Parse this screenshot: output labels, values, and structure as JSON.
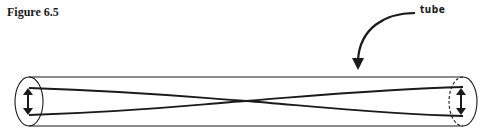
{
  "figure": {
    "title": "Figure 6.5",
    "label": "tube",
    "stroke_color": "#1a1a1a",
    "background": "#ffffff"
  },
  "diagram": {
    "elements": [
      {
        "type": "cylinder-tube",
        "name": "tube"
      },
      {
        "type": "crossed-strands",
        "name": "twisted-ribbon",
        "crossing_point": "center"
      },
      {
        "type": "double-arrow",
        "name": "left-end-arrow",
        "direction": "vertical"
      },
      {
        "type": "double-arrow",
        "name": "right-end-arrow",
        "direction": "vertical"
      },
      {
        "type": "curved-arrow",
        "name": "tube-pointer-arrow",
        "points_to": "tube"
      }
    ]
  }
}
